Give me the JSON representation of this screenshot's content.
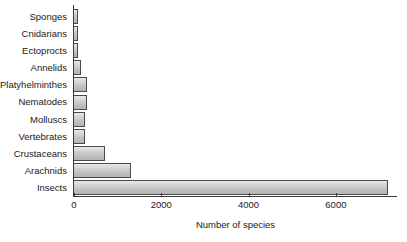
{
  "chart_data": {
    "type": "bar",
    "orientation": "horizontal",
    "title": "",
    "xlabel": "Number of species",
    "ylabel": "",
    "xlim": [
      0,
      7400
    ],
    "ylim": null,
    "grid": false,
    "legend": null,
    "xticks": [
      0,
      2000,
      4000,
      6000
    ],
    "xtick_labels": [
      "0",
      "2000",
      "4000",
      "6000"
    ],
    "categories": [
      "Sponges",
      "Cnidarians",
      "Ectoprocts",
      "Annelids",
      "Platyhelminthes",
      "Nematodes",
      "Molluscs",
      "Vertebrates",
      "Crustaceans",
      "Arachnids",
      "Insects"
    ],
    "values": [
      100,
      100,
      100,
      170,
      300,
      300,
      250,
      250,
      700,
      1300,
      7200
    ],
    "bar_face_color": "#d4d4d4",
    "bar_edge_color": "#4a4a4a",
    "axis_color": "#3a3a3a"
  }
}
